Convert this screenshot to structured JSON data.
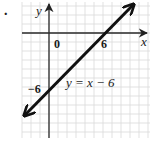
{
  "problem_marker": ".",
  "chart_data": {
    "type": "line",
    "title": "",
    "equation_label": "y = x − 6",
    "xlabel": "x",
    "ylabel": "y",
    "tick_labels": {
      "origin": "0",
      "x_intercept": "6",
      "y_intercept": "−6"
    },
    "series": [
      {
        "name": "y = x − 6",
        "slope": 1,
        "intercept": -6,
        "points": [
          {
            "x": -2.8,
            "y": -9.1
          },
          {
            "x": 0,
            "y": -6
          },
          {
            "x": 6,
            "y": 0
          },
          {
            "x": 9.4,
            "y": 3.2
          }
        ],
        "arrows_both_ends": true
      }
    ],
    "xlim": [
      -3,
      11
    ],
    "ylim": [
      -11.5,
      3.5
    ],
    "grid": true,
    "grid_step": 1,
    "legend": "none",
    "colors": {
      "line": "#111111",
      "axis": "#2a2a2a",
      "grid": "#d9d9d9"
    }
  }
}
